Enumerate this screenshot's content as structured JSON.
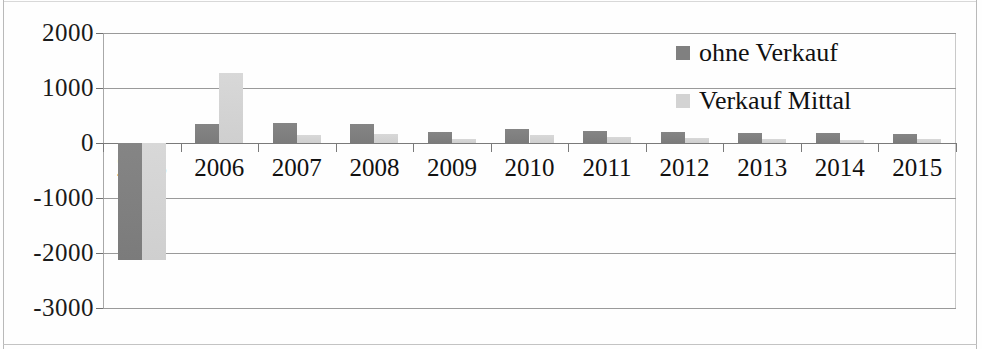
{
  "chart_data": {
    "type": "bar",
    "title": "",
    "xlabel": "",
    "ylabel": "",
    "ylim": [
      -3000,
      2000
    ],
    "ytick_step": 1000,
    "yticks": [
      "2000",
      "1000",
      "0",
      "-1000",
      "-2000",
      "-3000"
    ],
    "grid": true,
    "legend_position": "top-right",
    "categories": [
      "2005",
      "2006",
      "2007",
      "2008",
      "2009",
      "2010",
      "2011",
      "2012",
      "2013",
      "2014",
      "2015"
    ],
    "series": [
      {
        "name": "ohne Verkauf",
        "color": "#808080",
        "values": [
          -2120,
          340,
          370,
          345,
          200,
          255,
          220,
          195,
          190,
          175,
          165
        ]
      },
      {
        "name": "Verkauf Mittal",
        "color": "#d3d3d3",
        "values": [
          -2120,
          1265,
          150,
          160,
          80,
          140,
          105,
          90,
          75,
          55,
          70
        ]
      }
    ]
  },
  "legend": {
    "items": [
      {
        "label": "ohne Verkauf",
        "swatch": "dark"
      },
      {
        "label": "Verkauf Mittal",
        "swatch": "light"
      }
    ]
  },
  "colors": {
    "series_dark": "#808080",
    "series_light": "#d3d3d3",
    "gridline": "#9a9a9a",
    "text": "#111111",
    "background": "#ffffff"
  }
}
